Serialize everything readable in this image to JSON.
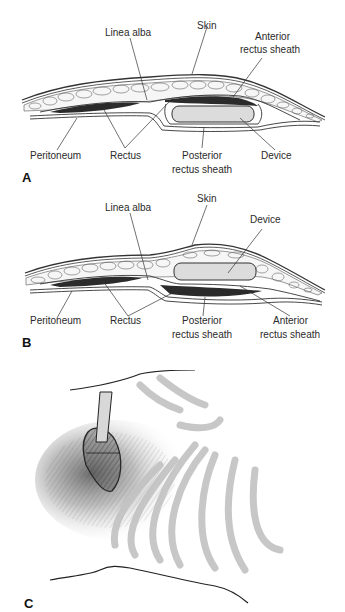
{
  "figure": {
    "panels": [
      {
        "letter": "A",
        "labels": {
          "linea_alba": "Linea alba",
          "skin": "Skin",
          "anterior_sheath_1": "Anterior",
          "anterior_sheath_2": "rectus sheath",
          "peritoneum": "Peritoneum",
          "rectus": "Rectus",
          "posterior_sheath_1": "Posterior",
          "posterior_sheath_2": "rectus sheath",
          "device": "Device"
        }
      },
      {
        "letter": "B",
        "labels": {
          "linea_alba": "Linea alba",
          "skin": "Skin",
          "device": "Device",
          "peritoneum": "Peritoneum",
          "rectus": "Rectus",
          "posterior_sheath_1": "Posterior",
          "posterior_sheath_2": "rectus sheath",
          "anterior_sheath_1": "Anterior",
          "anterior_sheath_2": "rectus sheath"
        }
      },
      {
        "letter": "C"
      }
    ],
    "colors": {
      "line": "#333333",
      "muscle": "#2b2b2b",
      "fat_fill": "#f4f4f4",
      "device_fill": "#dcdcdc",
      "ribs": "#c8c8c8",
      "shading": "#6a6a6a"
    }
  }
}
